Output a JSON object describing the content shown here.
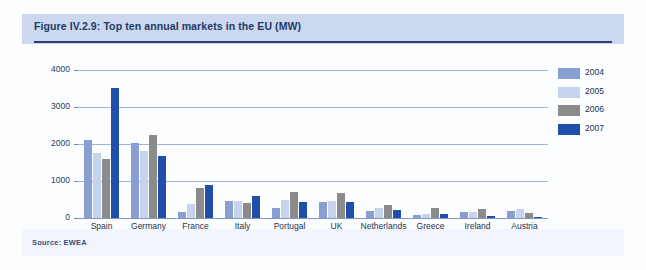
{
  "figure": {
    "title": "Figure IV.2.9: Top ten annual markets in the EU (MW)",
    "source": "Source: EWEA"
  },
  "colors": {
    "band": "#ccd8ee",
    "rule": "#2c3f74",
    "panel": "#f2f6fc",
    "plot": "#fbfdff",
    "grid": "#9fb4d8",
    "series_2004": "#8a9fd1",
    "series_2005": "#c5d3ec",
    "series_2006": "#8b8b8b",
    "series_2007": "#1f4fa8"
  },
  "chart_data": {
    "type": "bar",
    "title": "Figure IV.2.9: Top ten annual markets in the EU (MW)",
    "xlabel": "",
    "ylabel": "",
    "ylim": [
      0,
      4000
    ],
    "yticks": [
      "0",
      "1000",
      "2000",
      "3000",
      "4000"
    ],
    "grid": true,
    "legend_position": "right",
    "categories": [
      "Spain",
      "Germany",
      "France",
      "Italy",
      "Portugal",
      "UK",
      "Netherlands",
      "Greece",
      "Ireland",
      "Austria"
    ],
    "series": [
      {
        "name": "2004",
        "color": "#8a9fd1",
        "values": [
          2100,
          2037,
          150,
          450,
          274,
          430,
          197,
          90,
          150,
          192
        ]
      },
      {
        "name": "2005",
        "color": "#c5d3ec",
        "values": [
          1764,
          1808,
          389,
          452,
          500,
          447,
          258,
          100,
          151,
          231
        ]
      },
      {
        "name": "2006",
        "color": "#8b8b8b",
        "values": [
          1587,
          2233,
          810,
          417,
          694,
          668,
          356,
          270,
          250,
          146
        ]
      },
      {
        "name": "2007",
        "color": "#1f4fa8",
        "values": [
          3522,
          1667,
          888,
          603,
          434,
          427,
          219,
          110,
          59,
          20
        ]
      }
    ]
  }
}
